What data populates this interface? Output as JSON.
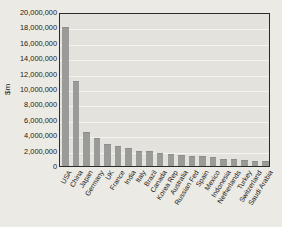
{
  "chart_data": {
    "type": "bar",
    "title": "",
    "xlabel": "",
    "ylabel": "$m",
    "ylim": [
      0,
      20000000
    ],
    "grid": true,
    "legend": "none",
    "y_ticks": [
      "20,000,000",
      "18,000,000",
      "16,000,000",
      "14,000,000",
      "12,000,000",
      "10,000,000",
      "8,000,000",
      "6,000,000",
      "4,000,000",
      "2,000,000",
      "0"
    ],
    "y_tick_values": [
      20000000,
      18000000,
      16000000,
      14000000,
      12000000,
      10000000,
      8000000,
      6000000,
      4000000,
      2000000,
      0
    ],
    "categories": [
      "USA",
      "China",
      "Japan",
      "Germany",
      "UK",
      "France",
      "India",
      "Italy",
      "Brazil",
      "Canada",
      "Korea Rep",
      "Australia",
      "Russian Fed",
      "Spain",
      "Mexico",
      "Indonesia",
      "Netherlands",
      "Turkey",
      "Switzerland",
      "Saudi Arabia"
    ],
    "values": [
      18000000,
      11000000,
      4400000,
      3600000,
      2900000,
      2600000,
      2300000,
      2000000,
      1900000,
      1700000,
      1600000,
      1400000,
      1350000,
      1300000,
      1150000,
      950000,
      870000,
      800000,
      700000,
      650000
    ],
    "bar_color": "#9a9a98",
    "plot_background": "#e4e2dc",
    "figure_background": "#eceae4",
    "axis_color": "#2b2b2b",
    "gridline_color": "#f5f4f0"
  }
}
